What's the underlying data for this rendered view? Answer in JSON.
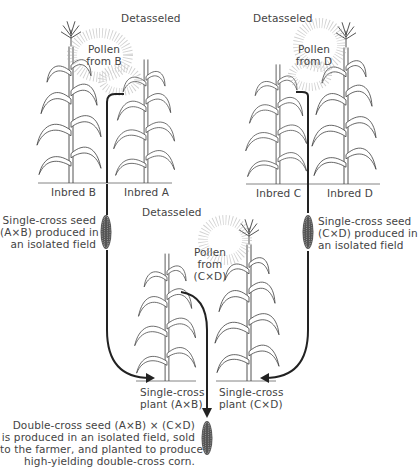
{
  "diagram": {
    "type": "double-cross hybrid corn breeding scheme",
    "top_left": {
      "detasseled_label": "Detasseled",
      "pollen_label_line1": "Pollen",
      "pollen_label_line2": "from B",
      "plants": [
        {
          "name": "Inbred B",
          "detasseled": false
        },
        {
          "name": "Inbred A",
          "detasseled": true
        }
      ],
      "seed_caption_line1": "Single-cross seed",
      "seed_caption_line2": "(A×B) produced in",
      "seed_caption_line3": "an isolated field"
    },
    "top_right": {
      "detasseled_label": "Detasseled",
      "pollen_label_line1": "Pollen",
      "pollen_label_line2": "from D",
      "plants": [
        {
          "name": "Inbred C",
          "detasseled": true
        },
        {
          "name": "Inbred D",
          "detasseled": false
        }
      ],
      "seed_caption_line1": "Single-cross seed",
      "seed_caption_line2": "(C×D) produced in",
      "seed_caption_line3": "an isolated field"
    },
    "middle": {
      "detasseled_label": "Detasseled",
      "pollen_label_line1": "Pollen",
      "pollen_label_line2": "from",
      "pollen_label_line3": "(C×D)",
      "plants": [
        {
          "name_line1": "Single-cross",
          "name_line2": "plant (A×B)",
          "detasseled": true
        },
        {
          "name_line1": "Single-cross",
          "name_line2": "plant (C×D)",
          "detasseled": false
        }
      ]
    },
    "result": {
      "caption_line1": "Double-cross seed (A×B) × (C×D)",
      "caption_line2": "is produced in an isolated field, sold",
      "caption_line3": "to the farmer, and planted to produce",
      "caption_line4": "high-yielding double-cross corn."
    },
    "colors": {
      "line": "#222222",
      "text": "#444444",
      "background": "#ffffff"
    }
  }
}
